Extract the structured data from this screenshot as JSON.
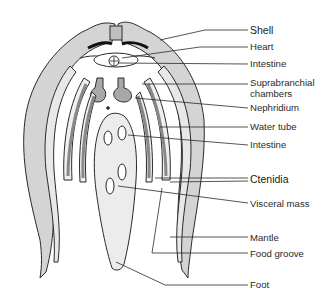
{
  "figure": {
    "labels": [
      {
        "id": "shell",
        "text": "Shell",
        "y": 30
      },
      {
        "id": "heart",
        "text": "Heart",
        "y": 47
      },
      {
        "id": "intestine-upper",
        "text": "Intestine",
        "y": 64
      },
      {
        "id": "suprabranchial",
        "text": "Suprabranchial",
        "y": 80
      },
      {
        "id": "suprabranchial-2",
        "text": "chambers",
        "y": 92
      },
      {
        "id": "nephridium",
        "text": "Nephridium",
        "y": 107
      },
      {
        "id": "water-tube",
        "text": "Water tube",
        "y": 126
      },
      {
        "id": "intestine-lower",
        "text": "Intestine",
        "y": 144
      },
      {
        "id": "ctenidia",
        "text": "Ctenidia",
        "y": 178
      },
      {
        "id": "visceral-mass",
        "text": "Visceral mass",
        "y": 203
      },
      {
        "id": "mantle",
        "text": "Mantle",
        "y": 237
      },
      {
        "id": "food-groove",
        "text": "Food groove",
        "y": 253
      },
      {
        "id": "foot",
        "text": "Foot",
        "y": 283
      }
    ]
  },
  "colors": {
    "outline": "#2a2a2a",
    "shell_fill": "#d4d4d4",
    "tissue_fill": "#ebebeb",
    "nephridium_fill": "#9a9a9a",
    "background": "#ffffff"
  }
}
